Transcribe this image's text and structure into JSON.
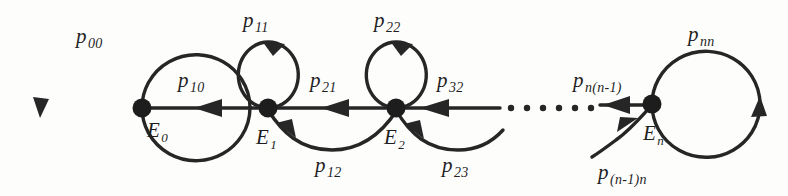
{
  "figure": {
    "type": "state-transition-diagram",
    "background_color": "#fdfdfc",
    "stroke_color": "#262626"
  },
  "states": [
    {
      "id": "E0",
      "base": "E",
      "sub": "0",
      "cx": 142,
      "cy": 108
    },
    {
      "id": "E1",
      "base": "E",
      "sub": "1",
      "cx": 268,
      "cy": 108
    },
    {
      "id": "E2",
      "base": "E",
      "sub": "2",
      "cx": 396,
      "cy": 108
    },
    {
      "id": "En",
      "base": "E",
      "sub": "n",
      "cx": 652,
      "cy": 104
    }
  ],
  "state_labels": [
    {
      "name": "state-label-E0",
      "base": "E",
      "sub": "0",
      "x": 147,
      "y": 120
    },
    {
      "name": "state-label-E1",
      "base": "E",
      "sub": "1",
      "x": 258,
      "y": 127
    },
    {
      "name": "state-label-E2",
      "base": "E",
      "sub": "2",
      "x": 386,
      "y": 127
    },
    {
      "name": "state-label-En",
      "base": "E",
      "sub": "n",
      "x": 643,
      "y": 123
    }
  ],
  "transition_labels": [
    {
      "name": "transition-label-p00",
      "base": "p",
      "sub": "00",
      "x": 76,
      "y": 26
    },
    {
      "name": "transition-label-p10",
      "base": "p",
      "sub": "10",
      "x": 178,
      "y": 70
    },
    {
      "name": "transition-label-p11",
      "base": "p",
      "sub": "11",
      "x": 243,
      "y": 10
    },
    {
      "name": "transition-label-p21",
      "base": "p",
      "sub": "21",
      "x": 310,
      "y": 70
    },
    {
      "name": "transition-label-p12",
      "base": "p",
      "sub": "12",
      "x": 315,
      "y": 155
    },
    {
      "name": "transition-label-p22",
      "base": "p",
      "sub": "22",
      "x": 374,
      "y": 10
    },
    {
      "name": "transition-label-p32",
      "base": "p",
      "sub": "32",
      "x": 437,
      "y": 70
    },
    {
      "name": "transition-label-p23",
      "base": "p",
      "sub": "23",
      "x": 442,
      "y": 155
    },
    {
      "name": "transition-label-pnn1",
      "base": "p",
      "sub": "n(n-1)",
      "x": 573,
      "y": 70
    },
    {
      "name": "transition-label-pnn",
      "base": "p",
      "sub": "nn",
      "x": 688,
      "y": 24
    },
    {
      "name": "transition-label-pn1n",
      "base": "p",
      "sub": "(n-1)n",
      "x": 598,
      "y": 162
    }
  ],
  "ellipsis": {
    "name": "ellipsis-between-E2-and-En",
    "dot_count": 6,
    "x_start": 508,
    "x_step": 16,
    "y": 108,
    "radius": 3.2
  },
  "geometry": {
    "big_loop_left": {
      "cx": 94,
      "cy": 107,
      "rx": 54,
      "ry": 53
    },
    "big_loop_right": {
      "cx": 706,
      "cy": 104,
      "rx": 54,
      "ry": 53
    },
    "small_loop_E1": {
      "cx": 268,
      "cy": 75,
      "rx": 30,
      "ry": 33
    },
    "small_loop_E2": {
      "cx": 396,
      "cy": 75,
      "rx": 30,
      "ry": 33
    },
    "axis_y": 108,
    "node_radius": 9
  }
}
